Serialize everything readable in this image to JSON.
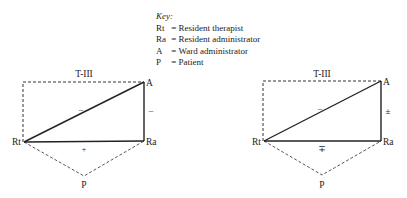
{
  "key": {
    "title": "Key:",
    "entries": [
      {
        "abbr": "Rt",
        "label": "= Resident therapist"
      },
      {
        "abbr": "Ra",
        "label": "= Resident administrator"
      },
      {
        "abbr": "A",
        "label": "= Ward administrator"
      },
      {
        "abbr": "P",
        "label": "= Patient"
      }
    ]
  },
  "diagrams": [
    {
      "title": "T-III",
      "nodes": {
        "Rt": "Rt",
        "Ra": "Ra",
        "A": "A",
        "P": "P"
      },
      "edges": {
        "Rt_A": "–",
        "A_Ra": "–",
        "Rt_Ra": "+"
      }
    },
    {
      "title": "T-III",
      "nodes": {
        "Rt": "Rt",
        "Ra": "Ra",
        "A": "A",
        "P": "P"
      },
      "edges": {
        "Rt_A": "–",
        "A_Ra": "±",
        "Rt_Ra": "∓"
      }
    }
  ]
}
